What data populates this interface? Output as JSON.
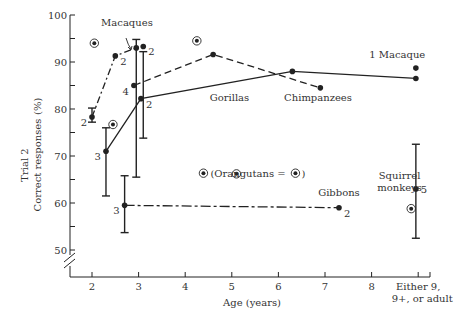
{
  "chart_data": {
    "type": "line",
    "title": "",
    "xlabel": "Age (years)",
    "ylabel_line1": "Trial 2",
    "ylabel_line2": "Correct responses",
    "ylabel_unit": "(%)",
    "xlim": [
      1.5,
      9.6
    ],
    "ylim": [
      50,
      100
    ],
    "y_axis_break": true,
    "x_ticks": [
      {
        "value": 2,
        "label": "2"
      },
      {
        "value": 3,
        "label": "3"
      },
      {
        "value": 4,
        "label": "4"
      },
      {
        "value": 5,
        "label": "5"
      },
      {
        "value": 6,
        "label": "6"
      },
      {
        "value": 7,
        "label": "7"
      },
      {
        "value": 8,
        "label": "8"
      },
      {
        "value": 9,
        "label": "Either 9,",
        "label2": "9+, or adult"
      }
    ],
    "y_ticks": [
      {
        "value": 50,
        "label": "50"
      },
      {
        "value": 55,
        "label": ""
      },
      {
        "value": 60,
        "label": "60"
      },
      {
        "value": 65,
        "label": ""
      },
      {
        "value": 70,
        "label": "70"
      },
      {
        "value": 75,
        "label": ""
      },
      {
        "value": 80,
        "label": "80"
      },
      {
        "value": 85,
        "label": ""
      },
      {
        "value": 90,
        "label": "90"
      },
      {
        "value": 95,
        "label": ""
      },
      {
        "value": 100,
        "label": "100"
      }
    ],
    "series": [
      {
        "name": "Macaques",
        "style": "dash-dot",
        "points": [
          {
            "x": 2.0,
            "y": 78.3,
            "n": "2",
            "err": [
              77.2,
              80.2
            ]
          },
          {
            "x": 2.5,
            "y": 91.3,
            "n": "2"
          },
          {
            "x": 2.95,
            "y": 93.0,
            "n": "",
            "err": [
              65.5,
              94.8
            ]
          }
        ]
      },
      {
        "name": "Macaques (isolated)",
        "style": "none",
        "points": [
          {
            "x": 3.1,
            "y": 93.3,
            "n": "2",
            "err": [
              73.8,
              92.2
            ]
          }
        ]
      },
      {
        "name": "Gorillas",
        "style": "dashed",
        "points": [
          {
            "x": 2.9,
            "y": 85.0,
            "n": "4"
          },
          {
            "x": 4.6,
            "y": 91.6,
            "n": ""
          },
          {
            "x": 6.9,
            "y": 84.5,
            "n": ""
          }
        ]
      },
      {
        "name": "Chimpanzees",
        "style": "solid",
        "points": [
          {
            "x": 2.3,
            "y": 71.0,
            "n": "3",
            "err": [
              61.5,
              76.0
            ]
          },
          {
            "x": 3.05,
            "y": 82.2,
            "n": "2"
          },
          {
            "x": 6.3,
            "y": 88.0,
            "n": ""
          },
          {
            "x": 8.95,
            "y": 86.5,
            "n": ""
          }
        ]
      },
      {
        "name": "Gibbons",
        "style": "dash-dot-long",
        "points": [
          {
            "x": 2.7,
            "y": 59.5,
            "n": "3",
            "err": [
              53.7,
              65.8
            ]
          },
          {
            "x": 7.3,
            "y": 59.0,
            "n": "2"
          }
        ]
      },
      {
        "name": "1 Macaque",
        "style": "none",
        "points": [
          {
            "x": 8.95,
            "y": 88.7,
            "n": ""
          }
        ]
      },
      {
        "name": "Squirrel monkeys",
        "style": "none",
        "points": [
          {
            "x": 8.95,
            "y": 63.0,
            "n": "5",
            "err": [
              52.5,
              72.5
            ]
          }
        ]
      },
      {
        "name": "Orangutans",
        "style": "marker-circled-dot",
        "points": [
          {
            "x": 2.05,
            "y": 94.0
          },
          {
            "x": 2.45,
            "y": 76.7
          },
          {
            "x": 4.25,
            "y": 94.5
          },
          {
            "x": 5.1,
            "y": 66.2
          },
          {
            "x": 8.85,
            "y": 58.8
          }
        ]
      }
    ],
    "annotations": [
      {
        "text": "Macaques",
        "x": 2.75,
        "y": 97.6
      },
      {
        "text": "Gorillas",
        "x": 4.95,
        "y": 81.8
      },
      {
        "text": "Chimpanzees",
        "x": 6.85,
        "y": 81.8
      },
      {
        "text": "1 Macaque",
        "x": 8.55,
        "y": 90.8
      },
      {
        "text": "(Orangutans = ",
        "x": 5.4,
        "y": 65.6,
        "suffix_marker": true
      },
      {
        "text": "Gibbons",
        "x": 7.3,
        "y": 61.5
      },
      {
        "text": "Squirrel",
        "x": 8.6,
        "y": 65.2
      },
      {
        "text": "monkeys",
        "x": 8.6,
        "y": 62.6
      }
    ]
  }
}
